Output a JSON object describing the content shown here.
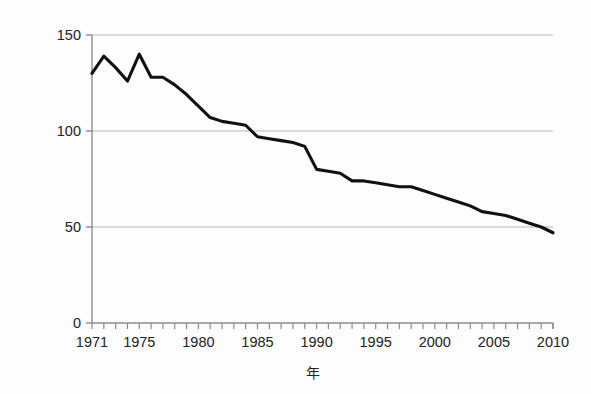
{
  "chart_data": {
    "type": "line",
    "title": "",
    "xlabel": "年",
    "ylabel": "乳児死亡率（‰）",
    "ylabel_chars": [
      "乳",
      "児",
      "死",
      "亡",
      "率",
      "（",
      "‰",
      "）"
    ],
    "xlim": [
      1971,
      2010
    ],
    "ylim": [
      0,
      150
    ],
    "yticks": [
      0,
      50,
      100,
      150
    ],
    "ytick_labels": [
      "0",
      "50",
      "100",
      "150"
    ],
    "xticks": [
      1971,
      1972,
      1973,
      1974,
      1975,
      1976,
      1977,
      1978,
      1979,
      1980,
      1981,
      1982,
      1983,
      1984,
      1985,
      1986,
      1987,
      1988,
      1989,
      1990,
      1991,
      1992,
      1993,
      1994,
      1995,
      1996,
      1997,
      1998,
      1999,
      2000,
      2001,
      2002,
      2003,
      2004,
      2005,
      2006,
      2007,
      2008,
      2009,
      2010
    ],
    "xtick_labels_shown": [
      "1971",
      "1975",
      "1980",
      "1985",
      "1990",
      "1995",
      "2000",
      "2005",
      "2010"
    ],
    "grid": "horizontal",
    "legend": "none",
    "line_color": "#111111",
    "grid_color": "#b7b7b7",
    "axis_color": "#8c8c8c",
    "background_color": "#fdfdfd",
    "x": [
      1971,
      1972,
      1973,
      1974,
      1975,
      1976,
      1977,
      1978,
      1979,
      1980,
      1981,
      1982,
      1983,
      1984,
      1985,
      1986,
      1987,
      1988,
      1989,
      1990,
      1991,
      1992,
      1993,
      1994,
      1995,
      1996,
      1997,
      1998,
      1999,
      2000,
      2001,
      2002,
      2003,
      2004,
      2005,
      2006,
      2007,
      2008,
      2009,
      2010
    ],
    "values": [
      130,
      139,
      133,
      126,
      140,
      128,
      128,
      124,
      119,
      113,
      107,
      105,
      104,
      103,
      97,
      96,
      95,
      94,
      92,
      80,
      79,
      78,
      74,
      74,
      73,
      72,
      71,
      71,
      69,
      67,
      65,
      63,
      61,
      58,
      57,
      56,
      54,
      52,
      50,
      47
    ]
  },
  "axis_title_x": "年"
}
